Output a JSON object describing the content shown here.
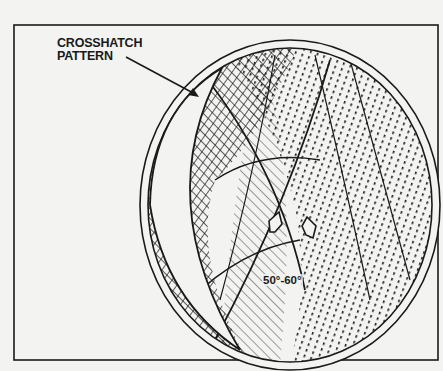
{
  "figure": {
    "type": "cylinder-bore-crosshatch-illustration",
    "callout": {
      "line1": "CROSSHATCH",
      "line2": "PATTERN",
      "arrow": "leader-arrow-to-crosshatch"
    },
    "angle_label": "50°-60°",
    "colors": {
      "ink": "#1a1a1a",
      "paper": "#f3f3f1"
    }
  }
}
